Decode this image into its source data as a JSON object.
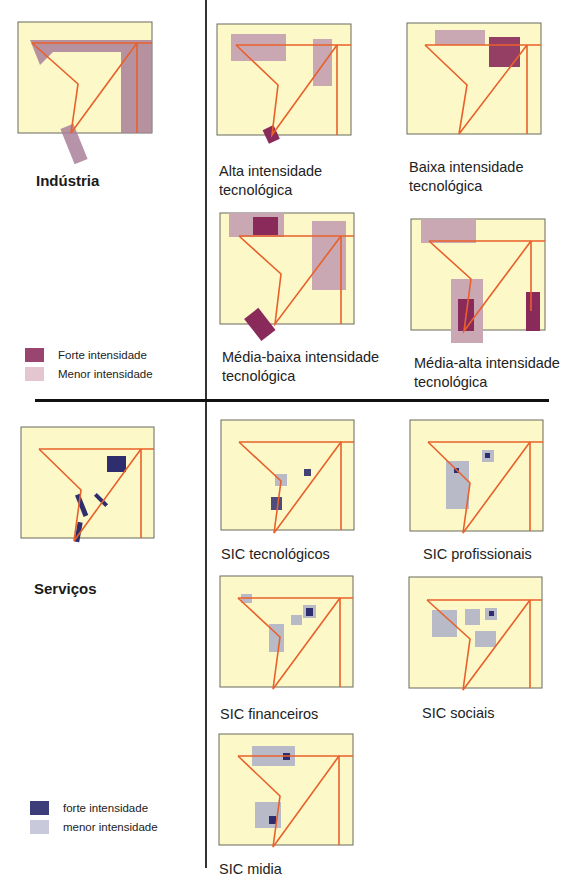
{
  "colors": {
    "map_bg": "#fdf8c8",
    "map_border": "#6b6b5e",
    "road": "#e8602a",
    "industry_strong": "#8a2a5a",
    "industry_weak": "#c9a8b4",
    "industry_main": "#a9809a",
    "service_strong": "#2e2e6e",
    "service_weak": "#b9bac8"
  },
  "industry": {
    "title": "Indústria",
    "legend": [
      {
        "label": "Forte intensidade",
        "color": "#9a4470"
      },
      {
        "label": "Menor intensidade",
        "color": "#e4c6d0"
      }
    ],
    "panels": [
      {
        "id": "alta",
        "caption_line1": "Alta intensidade",
        "caption_line2": "tecnológica"
      },
      {
        "id": "baixa",
        "caption_line1": "Baixa intensidade",
        "caption_line2": "tecnológica"
      },
      {
        "id": "media-baixa",
        "caption_line1": "Média-baixa intensidade",
        "caption_line2": "tecnológica"
      },
      {
        "id": "media-alta",
        "caption_line1": "Média-alta intensidade",
        "caption_line2": "tecnológica"
      }
    ]
  },
  "services": {
    "title": "Serviços",
    "legend": [
      {
        "label": "forte intensidade",
        "color": "#3d3d7a"
      },
      {
        "label": "menor intensidade",
        "color": "#c8cadb"
      }
    ],
    "panels": [
      {
        "id": "sic-tecnologicos",
        "caption": "SIC tecnológicos"
      },
      {
        "id": "sic-profissionais",
        "caption": "SIC profissionais"
      },
      {
        "id": "sic-financeiros",
        "caption": "SIC financeiros"
      },
      {
        "id": "sic-sociais",
        "caption": "SIC sociais"
      },
      {
        "id": "sic-midia",
        "caption": "SIC midia"
      }
    ]
  }
}
